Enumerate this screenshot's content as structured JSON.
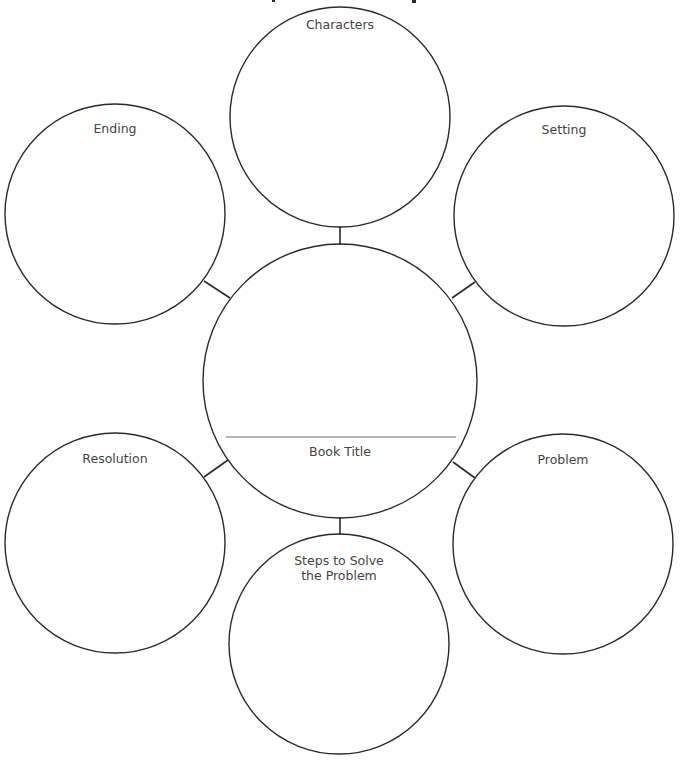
{
  "worksheet": {
    "type": "story map / book web graphic organizer",
    "center": {
      "label": "Book Title",
      "cx": 340,
      "cy": 381,
      "r": 137,
      "title_line": {
        "x1": 226,
        "x2": 456,
        "y": 437
      },
      "label_pos": {
        "x": 340,
        "y": 444
      }
    },
    "nodes": [
      {
        "id": "characters",
        "label": "Characters",
        "cx": 340,
        "cy": 117,
        "r": 110,
        "label_pos": {
          "x": 340,
          "y": 17
        },
        "connector": {
          "x1": 340,
          "y1": 227,
          "x2": 340,
          "y2": 245
        }
      },
      {
        "id": "setting",
        "label": "Setting",
        "cx": 564,
        "cy": 216,
        "r": 110,
        "label_pos": {
          "x": 564,
          "y": 122
        },
        "connector": {
          "x1": 475,
          "y1": 282,
          "x2": 452,
          "y2": 298
        }
      },
      {
        "id": "problem",
        "label": "Problem",
        "cx": 563,
        "cy": 544,
        "r": 110,
        "label_pos": {
          "x": 563,
          "y": 452
        },
        "connector": {
          "x1": 475,
          "y1": 478,
          "x2": 453,
          "y2": 462
        }
      },
      {
        "id": "steps",
        "label": "Steps to Solve\nthe Problem",
        "cx": 339,
        "cy": 644,
        "r": 110,
        "label_pos": {
          "x": 339,
          "y": 553
        },
        "connector": {
          "x1": 340,
          "y1": 517,
          "x2": 340,
          "y2": 535
        }
      },
      {
        "id": "resolution",
        "label": "Resolution",
        "cx": 115,
        "cy": 543,
        "r": 110,
        "label_pos": {
          "x": 115,
          "y": 451
        },
        "connector": {
          "x1": 204,
          "y1": 477,
          "x2": 228,
          "y2": 460
        }
      },
      {
        "id": "ending",
        "label": "Ending",
        "cx": 115,
        "cy": 214,
        "r": 110,
        "label_pos": {
          "x": 115,
          "y": 121
        },
        "connector": {
          "x1": 204,
          "y1": 281,
          "x2": 230,
          "y2": 298
        }
      }
    ]
  }
}
